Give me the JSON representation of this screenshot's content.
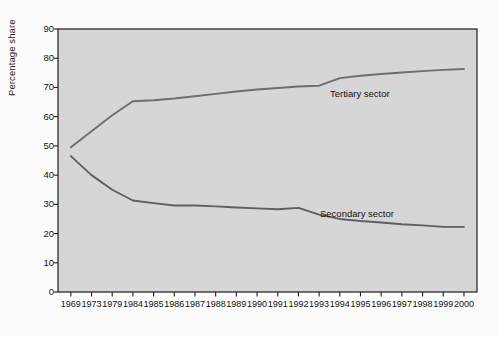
{
  "chart_data": {
    "type": "line",
    "title": "",
    "xlabel": "",
    "ylabel": "Percentage share",
    "ylim": [
      0,
      90
    ],
    "ytick_step": 10,
    "yticks": [
      0,
      10,
      20,
      30,
      40,
      50,
      60,
      70,
      80,
      90
    ],
    "grid": false,
    "legend_position": "inline-annotations",
    "categories": [
      "1969",
      "1973",
      "1979",
      "1984",
      "1985",
      "1986",
      "1987",
      "1988",
      "1989",
      "1990",
      "1991",
      "1992",
      "1993",
      "1994",
      "1995",
      "1996",
      "1997",
      "1998",
      "1999",
      "2000"
    ],
    "series": [
      {
        "name": "Tertiary sector",
        "color": "#6e6e6e",
        "values": [
          49.5,
          55.0,
          60.5,
          65.3,
          65.6,
          66.2,
          67.0,
          67.8,
          68.6,
          69.3,
          69.8,
          70.3,
          70.6,
          73.2,
          74.0,
          74.6,
          75.1,
          75.6,
          76.0,
          76.3
        ]
      },
      {
        "name": "Secondary sector",
        "color": "#5f5f5f",
        "values": [
          46.5,
          40.0,
          35.0,
          31.3,
          30.4,
          29.6,
          29.6,
          29.3,
          28.9,
          28.6,
          28.3,
          28.8,
          26.5,
          25.0,
          24.3,
          23.8,
          23.2,
          22.8,
          22.3,
          22.3
        ]
      }
    ],
    "annotations": [
      {
        "text": "Tertiary sector",
        "x_px": 330,
        "y_px": 88
      },
      {
        "text": "Secondary sector",
        "x_px": 320,
        "y_px": 208
      }
    ],
    "colors": {
      "plot_background": "#d6d6d6",
      "figure_background": "#fcfcfc",
      "axis": "#1a1a1a",
      "text": "#111111"
    }
  }
}
